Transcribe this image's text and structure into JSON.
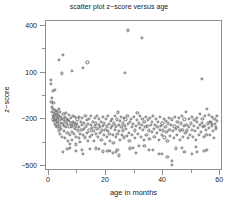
{
  "chart_data": {
    "type": "scatter",
    "title": "scatter plot z−score versus age",
    "xlabel": "age in months",
    "ylabel": "z−score",
    "grid": false,
    "legend": null,
    "xlim": [
      -1,
      61
    ],
    "ylim": [
      -530,
      430
    ],
    "xticks": [
      0,
      20,
      40,
      60
    ],
    "xticklabels": [
      "0",
      "20",
      "40",
      "60"
    ],
    "xminorticks": [
      10,
      30,
      50
    ],
    "yticks": [
      400,
      100,
      -200,
      -500
    ],
    "yticklabels": [
      "400",
      "100",
      "−200",
      "−500"
    ],
    "yminorticks": [
      250,
      -50,
      -350
    ],
    "marker": "open-circle",
    "marker_color": "#6f6f6f",
    "marker_size": 3,
    "n_points": 330,
    "x": [
      0.6,
      0.7,
      0.9,
      1.0,
      1.1,
      1.2,
      1.3,
      1.4,
      1.5,
      1.6,
      1.7,
      1.8,
      1.9,
      2.0,
      2.1,
      2.2,
      2.3,
      2.4,
      2.5,
      2.6,
      2.7,
      2.8,
      2.9,
      3.0,
      3.1,
      3.2,
      3.3,
      3.4,
      3.5,
      3.6,
      3.7,
      3.8,
      3.9,
      4.0,
      4.1,
      4.2,
      4.3,
      4.5,
      4.6,
      4.8,
      5.0,
      5.1,
      5.2,
      5.3,
      5.4,
      5.5,
      5.6,
      5.8,
      6.0,
      6.1,
      6.2,
      6.3,
      6.5,
      6.6,
      6.8,
      7.0,
      7.1,
      7.2,
      7.4,
      7.5,
      7.6,
      7.8,
      8.0,
      8.1,
      8.2,
      8.4,
      8.5,
      8.6,
      8.8,
      9.0,
      9.1,
      9.2,
      9.4,
      9.5,
      9.6,
      9.8,
      10.0,
      10.2,
      10.4,
      10.5,
      10.6,
      10.8,
      11.0,
      11.2,
      11.4,
      11.5,
      11.6,
      11.8,
      12.0,
      12.2,
      12.4,
      12.6,
      12.8,
      13.0,
      13.2,
      13.4,
      13.6,
      13.8,
      14.0,
      14.2,
      14.4,
      14.6,
      14.8,
      15.0,
      15.2,
      15.4,
      15.6,
      15.8,
      16.0,
      16.2,
      16.4,
      16.6,
      16.8,
      17.0,
      17.2,
      17.4,
      17.6,
      17.8,
      18.0,
      18.2,
      18.4,
      18.6,
      18.8,
      19.0,
      19.2,
      19.4,
      19.6,
      19.8,
      20.0,
      20.2,
      20.4,
      20.6,
      20.8,
      21.0,
      21.2,
      21.4,
      21.6,
      21.8,
      22.0,
      22.2,
      22.4,
      22.6,
      22.8,
      23.0,
      23.2,
      23.4,
      23.6,
      23.8,
      24.0,
      24.2,
      24.4,
      24.6,
      24.8,
      25.0,
      25.2,
      25.4,
      25.6,
      25.8,
      26.0,
      26.2,
      26.4,
      26.6,
      26.8,
      27.0,
      27.2,
      27.5,
      27.8,
      28.0,
      28.2,
      28.5,
      28.8,
      29.0,
      29.2,
      29.5,
      29.8,
      30.0,
      30.2,
      30.5,
      30.8,
      31.0,
      31.2,
      31.5,
      31.8,
      32.0,
      32.2,
      32.5,
      32.8,
      33.0,
      33.2,
      33.5,
      33.8,
      34.0,
      34.2,
      34.5,
      34.8,
      35.0,
      35.2,
      35.5,
      35.8,
      36.0,
      36.2,
      36.5,
      36.8,
      37.0,
      37.2,
      37.5,
      37.8,
      38.0,
      38.2,
      38.5,
      38.8,
      39.0,
      39.2,
      39.5,
      39.8,
      40.0,
      40.2,
      40.5,
      40.8,
      41.0,
      41.2,
      41.5,
      41.8,
      42.0,
      42.2,
      42.5,
      42.8,
      43.0,
      43.2,
      43.5,
      43.8,
      44.0,
      44.2,
      44.5,
      44.8,
      45.0,
      45.2,
      45.5,
      45.8,
      46.0,
      46.2,
      46.5,
      46.8,
      47.0,
      47.2,
      47.5,
      47.8,
      48.0,
      48.2,
      48.5,
      48.8,
      49.0,
      49.2,
      49.5,
      49.8,
      50.0,
      50.2,
      50.5,
      50.8,
      51.0,
      51.2,
      51.5,
      51.8,
      52.0,
      52.2,
      52.5,
      52.8,
      53.0,
      53.2,
      53.5,
      53.8,
      54.0,
      54.2,
      54.5,
      54.8,
      55.0,
      55.2,
      55.5,
      55.8,
      56.0,
      56.2,
      56.5,
      56.8,
      57.0,
      57.2,
      57.5,
      57.8,
      58.0,
      58.2,
      58.5,
      58.8,
      59.0,
      3.5,
      5.0,
      8.0,
      12.0,
      20.5,
      24.5,
      27.8,
      30.5,
      24.0,
      32.5,
      43.2,
      50.2,
      53.5,
      57.0,
      1.3,
      2.2,
      9.5,
      14.5,
      19.0,
      22.5,
      28.5,
      35.0,
      38.5,
      41.5,
      46.5,
      52.0,
      55.5,
      58.5,
      4.5,
      7.5,
      13.5,
      17.5,
      21.5,
      26.5,
      31.5,
      36.5,
      39.5,
      44.5,
      47.5,
      51.5,
      54.5,
      56.5,
      6.5,
      11.5,
      16.5,
      23.5,
      29.5,
      33.5
    ],
    "y": [
      55,
      30,
      -90,
      -120,
      -60,
      -150,
      -175,
      -200,
      -130,
      -95,
      -160,
      -210,
      -185,
      -140,
      -170,
      -230,
      -195,
      -155,
      -205,
      -240,
      -180,
      -145,
      -215,
      -250,
      -165,
      -190,
      -225,
      -270,
      -135,
      -175,
      -205,
      -245,
      -290,
      -150,
      -185,
      -220,
      -260,
      -195,
      -310,
      -230,
      215,
      -165,
      -200,
      -240,
      -275,
      -320,
      -185,
      -215,
      -250,
      -160,
      -195,
      -230,
      -285,
      -340,
      -205,
      -170,
      -210,
      -245,
      -300,
      -355,
      -225,
      -190,
      -250,
      -280,
      -330,
      -215,
      -175,
      -235,
      -295,
      -260,
      -220,
      -185,
      -245,
      -310,
      -360,
      -230,
      -200,
      -270,
      -320,
      -185,
      -250,
      -290,
      -345,
      -215,
      -265,
      -190,
      -235,
      -300,
      130,
      -220,
      -260,
      -315,
      -180,
      -245,
      -285,
      -205,
      -340,
      -230,
      -195,
      -270,
      -310,
      -235,
      -180,
      -255,
      -300,
      -215,
      -275,
      -340,
      -190,
      -245,
      -290,
      -225,
      -180,
      -260,
      -310,
      -235,
      -195,
      -285,
      -250,
      -215,
      -330,
      -270,
      -185,
      -240,
      -300,
      -225,
      -355,
      -265,
      -195,
      -245,
      -310,
      -180,
      -275,
      -230,
      -290,
      -335,
      -210,
      -255,
      -195,
      -240,
      -300,
      -350,
      -225,
      -180,
      -265,
      -310,
      -245,
      -200,
      -290,
      -155,
      -235,
      -275,
      -330,
      -210,
      -185,
      -250,
      -300,
      -225,
      -270,
      -190,
      -315,
      -240,
      -200,
      -260,
      -305,
      -175,
      -230,
      -285,
      -340,
      -215,
      -195,
      -250,
      -300,
      -230,
      -185,
      -270,
      -320,
      -240,
      -205,
      -160,
      -290,
      -225,
      -180,
      -255,
      -310,
      -235,
      -195,
      -265,
      -330,
      -215,
      -250,
      -185,
      -300,
      -240,
      -205,
      -270,
      -325,
      -190,
      -235,
      -280,
      -215,
      -175,
      -260,
      -310,
      -235,
      -195,
      -285,
      -250,
      -215,
      -330,
      -265,
      -185,
      -240,
      -300,
      -225,
      -270,
      -195,
      -315,
      -250,
      -210,
      -280,
      -340,
      -225,
      -190,
      -265,
      -305,
      -235,
      -465,
      -200,
      -275,
      -320,
      -245,
      -185,
      -260,
      -300,
      -215,
      -250,
      -190,
      -330,
      -270,
      -225,
      -180,
      -265,
      -310,
      -240,
      -200,
      -285,
      -150,
      -235,
      -270,
      -320,
      -195,
      -250,
      -300,
      -225,
      -185,
      -265,
      -310,
      -240,
      -205,
      -275,
      -330,
      -215,
      -190,
      -255,
      -300,
      -235,
      -165,
      -280,
      -220,
      -195,
      -250,
      -310,
      -240,
      -180,
      -265,
      -300,
      -130,
      -225,
      -170,
      -255,
      -300,
      -215,
      -185,
      -240,
      -275,
      -320,
      -195,
      -230,
      -260,
      -210,
      -175,
      180,
      -410,
      110,
      -420,
      -400,
      -430,
      370,
      -415,
      -395,
      320,
      -490,
      -420,
      60,
      -230,
      -20,
      -10,
      -400,
      -390,
      -405,
      -415,
      -385,
      -395,
      -420,
      -440,
      -380,
      -410,
      -395,
      -250,
      95,
      -380,
      165,
      -390,
      -400,
      100,
      -370,
      -395,
      -420,
      -385,
      -410,
      -375,
      -400,
      -215,
      -390,
      -395,
      -385,
      -410,
      -380,
      -370
    ]
  }
}
